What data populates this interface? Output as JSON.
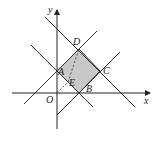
{
  "diagram": {
    "type": "coordinate-geometry",
    "axes": {
      "x_label": "x",
      "y_label": "y",
      "origin_label": "O"
    },
    "points": {
      "A": {
        "label": "A",
        "px": [
          57,
          71
        ]
      },
      "B": {
        "label": "B",
        "px": [
          79,
          93
        ]
      },
      "C": {
        "label": "C",
        "px": [
          100,
          71
        ]
      },
      "D": {
        "label": "D",
        "px": [
          79,
          49
        ]
      },
      "E": {
        "label": "E",
        "px": [
          68,
          82
        ]
      }
    },
    "shaded_region": "square ABCD",
    "fill_color": "#c8c8c8",
    "line_color": "#333333"
  }
}
